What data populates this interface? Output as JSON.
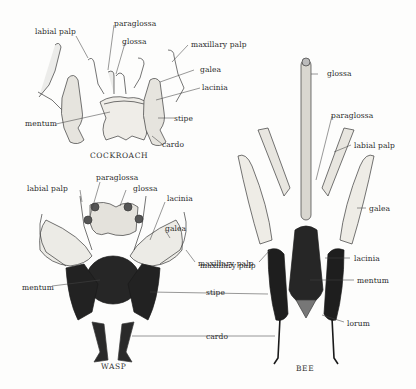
{
  "figure": {
    "specimens": [
      {
        "name": "cockroach",
        "caption": "COCKROACH",
        "labels": [
          "labial palp",
          "paraglossa",
          "glossa",
          "maxillary palp",
          "galea",
          "lacinia",
          "mentum",
          "stipe",
          "cardo"
        ]
      },
      {
        "name": "wasp",
        "caption": "WASP",
        "labels": [
          "labial palp",
          "paraglossa",
          "glossa",
          "lacinia",
          "galea",
          "maxillary palp",
          "mentum"
        ]
      },
      {
        "name": "bee",
        "caption": "BEE",
        "labels": [
          "glossa",
          "paraglossa",
          "labial palp",
          "galea",
          "maxillary palp",
          "lacinia",
          "mentum",
          "stipe",
          "cardo",
          "lorum"
        ]
      }
    ],
    "shared_labels": {
      "stipe": "stipe",
      "cardo": "cardo"
    },
    "colors": {
      "ink": "#2a2a2a",
      "dark_fill": "#1e1e1e",
      "light_fill": "#e8e6e0",
      "background": "#fdfdfc"
    }
  }
}
